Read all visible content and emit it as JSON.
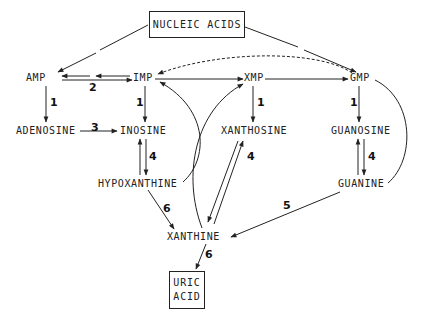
{
  "diagram": {
    "nodes": {
      "nucleic_acids": "NUCLEIC ACIDS",
      "amp": "AMP",
      "imp": "IMP",
      "xmp": "XMP",
      "gmp": "GMP",
      "adenosine": "ADENOSINE",
      "inosine": "INOSINE",
      "xanthosine": "XANTHOSINE",
      "guanosine": "GUANOSINE",
      "hypoxanthine": "HYPOXANTHINE",
      "guanine": "GUANINE",
      "xanthine": "XANTHINE",
      "uric_acid_line1": "URIC",
      "uric_acid_line2": "ACID"
    },
    "enzyme_labels": {
      "amp_imp": "2",
      "amp_adenosine": "1",
      "imp_inosine": "1",
      "xmp_xanthosine": "1",
      "gmp_guanosine": "1",
      "adenosine_inosine": "3",
      "inosine_hypoxanthine": "4",
      "xanthosine_xanthine": "4",
      "guanosine_guanine": "4",
      "guanine_xanthine": "5",
      "hypoxanthine_xanthine": "6",
      "xanthine_uric_acid": "6"
    },
    "edges": [
      {
        "from": "NUCLEIC ACIDS",
        "to": "AMP",
        "style": "solid"
      },
      {
        "from": "NUCLEIC ACIDS",
        "to": "GMP",
        "style": "solid"
      },
      {
        "from": "AMP",
        "to": "IMP",
        "style": "solid",
        "label": "2",
        "bidirectional": true
      },
      {
        "from": "IMP",
        "to": "XMP",
        "style": "solid"
      },
      {
        "from": "XMP",
        "to": "GMP",
        "style": "solid"
      },
      {
        "from": "GMP",
        "to": "IMP",
        "style": "dashed"
      },
      {
        "from": "AMP",
        "to": "ADENOSINE",
        "label": "1"
      },
      {
        "from": "IMP",
        "to": "INOSINE",
        "label": "1"
      },
      {
        "from": "XMP",
        "to": "XANTHOSINE",
        "label": "1"
      },
      {
        "from": "GMP",
        "to": "GUANOSINE",
        "label": "1"
      },
      {
        "from": "ADENOSINE",
        "to": "INOSINE",
        "label": "3"
      },
      {
        "from": "INOSINE",
        "to": "HYPOXANTHINE",
        "label": "4",
        "bidirectional": true
      },
      {
        "from": "XANTHOSINE",
        "to": "XANTHINE",
        "label": "4",
        "bidirectional": true
      },
      {
        "from": "GUANOSINE",
        "to": "GUANINE",
        "label": "4",
        "bidirectional": true
      },
      {
        "from": "HYPOXANTHINE",
        "to": "IMP",
        "style": "curved"
      },
      {
        "from": "XANTHINE",
        "to": "XMP",
        "style": "curved"
      },
      {
        "from": "GUANINE",
        "to": "GMP",
        "style": "curved"
      },
      {
        "from": "GUANINE",
        "to": "XANTHINE",
        "label": "5"
      },
      {
        "from": "HYPOXANTHINE",
        "to": "XANTHINE",
        "label": "6"
      },
      {
        "from": "XANTHINE",
        "to": "URIC ACID",
        "label": "6"
      }
    ],
    "colors": {
      "ink": "#222222",
      "background": "#ffffff"
    }
  }
}
